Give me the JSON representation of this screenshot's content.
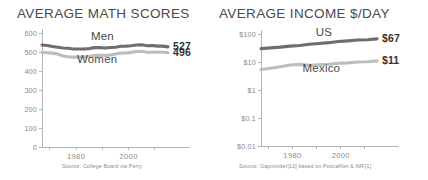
{
  "figure": {
    "panels": [
      {
        "id": "math-scores",
        "title": "AVERAGE MATH SCORES",
        "source": "Source: College Board via Perry"
      },
      {
        "id": "average-income",
        "title": "AVERAGE INCOME $/DAY",
        "source": "Source: Gapminder[10] based on PovcalNet & IMF[1]"
      }
    ]
  },
  "colors": {
    "series_dark": "#6e6e6e",
    "series_light": "#bdbdbd",
    "axis": "#b4b4b4",
    "text": "#4a4a4a",
    "muted_text": "#8a8a8a",
    "background": "#ffffff"
  },
  "chart_data": [
    {
      "type": "line",
      "id": "math-scores",
      "title": "AVERAGE MATH SCORES",
      "xlabel": "",
      "ylabel": "",
      "xlim": [
        1967,
        2015
      ],
      "ylim": [
        0,
        600
      ],
      "yscale": "linear",
      "grid": false,
      "legend": "inline-labels",
      "ytick_labels": [
        "600",
        "500",
        "400",
        "300",
        "200",
        "100",
        "0"
      ],
      "ytick_values": [
        600,
        500,
        400,
        300,
        200,
        100,
        0
      ],
      "xtick_values": [
        1970,
        1980,
        1990,
        2000,
        2010
      ],
      "xtick_labels": [
        "",
        "1980",
        "",
        "2000",
        ""
      ],
      "annotations": [
        {
          "text": "Men",
          "x": 1990,
          "y": 565
        },
        {
          "text": "Women",
          "x": 1988,
          "y": 440
        },
        {
          "text": "527",
          "x": 2016,
          "y": 527
        },
        {
          "text": "496",
          "x": 2016,
          "y": 496
        }
      ],
      "end_values": {
        "Men": 527,
        "Women": 496
      },
      "source": "Source: College Board via Perry",
      "series": [
        {
          "name": "Men",
          "color": "#6e6e6e",
          "x": [
            1967,
            1969,
            1971,
            1973,
            1975,
            1977,
            1979,
            1981,
            1983,
            1985,
            1987,
            1989,
            1991,
            1993,
            1995,
            1997,
            1999,
            2001,
            2003,
            2005,
            2007,
            2009,
            2011,
            2013,
            2015
          ],
          "values": [
            537,
            534,
            529,
            525,
            521,
            520,
            516,
            516,
            516,
            518,
            523,
            523,
            521,
            524,
            525,
            530,
            531,
            533,
            537,
            538,
            533,
            534,
            531,
            531,
            527
          ]
        },
        {
          "name": "Women",
          "color": "#bdbdbd",
          "x": [
            1967,
            1969,
            1971,
            1973,
            1975,
            1977,
            1979,
            1981,
            1983,
            1985,
            1987,
            1989,
            1991,
            1993,
            1995,
            1997,
            1999,
            2001,
            2003,
            2005,
            2007,
            2009,
            2011,
            2013,
            2015
          ],
          "values": [
            498,
            496,
            494,
            489,
            479,
            475,
            473,
            473,
            474,
            477,
            481,
            482,
            482,
            484,
            489,
            494,
            495,
            498,
            503,
            504,
            499,
            499,
            500,
            499,
            496
          ]
        }
      ]
    },
    {
      "type": "line",
      "id": "average-income",
      "title": "AVERAGE INCOME $/DAY",
      "xlabel": "",
      "ylabel": "",
      "xlim": [
        1967,
        2015
      ],
      "ylim": [
        0.01,
        100
      ],
      "yscale": "log",
      "grid": false,
      "legend": "inline-labels",
      "ytick_labels": [
        "$100",
        "$10",
        "$1",
        "$0.1",
        "$0.01"
      ],
      "ytick_values": [
        100,
        10,
        1,
        0.1,
        0.01
      ],
      "xtick_values": [
        1970,
        1980,
        1990,
        2000,
        2010
      ],
      "xtick_labels": [
        "",
        "1980",
        "",
        "2000",
        ""
      ],
      "annotations": [
        {
          "text": "US",
          "x": 1993,
          "y": 88
        },
        {
          "text": "Mexico",
          "x": 1992,
          "y": 4.3
        },
        {
          "text": "$67",
          "x": 2016,
          "y": 67
        },
        {
          "text": "$11",
          "x": 2016,
          "y": 11
        }
      ],
      "end_values": {
        "US": 67,
        "Mexico": 11
      },
      "source": "Source: Gapminder[10] based on PovcalNet & IMF[1]",
      "series": [
        {
          "name": "US",
          "color": "#6e6e6e",
          "x": [
            1967,
            1971,
            1975,
            1979,
            1983,
            1987,
            1991,
            1995,
            1999,
            2003,
            2007,
            2011,
            2015
          ],
          "values": [
            30,
            32,
            34,
            37,
            39,
            43,
            46,
            49,
            54,
            57,
            61,
            62,
            67
          ]
        },
        {
          "name": "Mexico",
          "color": "#bdbdbd",
          "x": [
            1967,
            1971,
            1975,
            1979,
            1983,
            1987,
            1991,
            1995,
            1999,
            2003,
            2007,
            2011,
            2015
          ],
          "values": [
            5.4,
            6.0,
            6.8,
            7.8,
            8.2,
            7.6,
            8.0,
            8.3,
            9.0,
            9.3,
            10.0,
            10.2,
            11
          ]
        }
      ]
    }
  ]
}
